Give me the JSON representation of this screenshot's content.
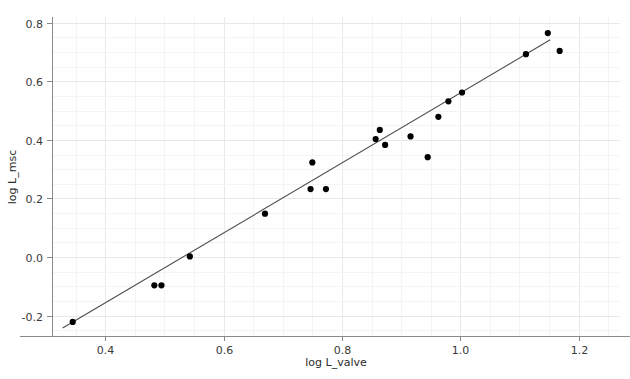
{
  "chart_data": {
    "type": "scatter",
    "title": "",
    "subtitle": "",
    "xlabel": "log L_valve",
    "ylabel": "log L_msc",
    "xlim": [
      0.31,
      1.27
    ],
    "ylim": [
      -0.27,
      0.82
    ],
    "grid": true,
    "legend": null,
    "x_ticks": [
      0.4,
      0.6,
      0.8,
      1.0,
      1.2
    ],
    "x_tick_labels": [
      "0.4",
      "0.6",
      "0.8",
      "1.0",
      "1.2"
    ],
    "y_ticks": [
      -0.2,
      0.0,
      0.2,
      0.4,
      0.6,
      0.8
    ],
    "y_tick_labels": [
      "-0.2",
      "0.0",
      "0.2",
      "0.4",
      "0.6",
      "0.8"
    ],
    "point_color": "#000000",
    "line_color": "#4d4d4d",
    "grid_color": "#e9e9e9",
    "marker_size": 3.1,
    "points": [
      {
        "x": 0.345,
        "y": -0.222
      },
      {
        "x": 0.483,
        "y": -0.097
      },
      {
        "x": 0.495,
        "y": -0.097
      },
      {
        "x": 0.543,
        "y": 0.002
      },
      {
        "x": 0.67,
        "y": 0.148
      },
      {
        "x": 0.75,
        "y": 0.323
      },
      {
        "x": 0.747,
        "y": 0.232
      },
      {
        "x": 0.773,
        "y": 0.232
      },
      {
        "x": 0.857,
        "y": 0.403
      },
      {
        "x": 0.864,
        "y": 0.434
      },
      {
        "x": 0.873,
        "y": 0.383
      },
      {
        "x": 0.916,
        "y": 0.412
      },
      {
        "x": 0.945,
        "y": 0.341
      },
      {
        "x": 0.963,
        "y": 0.479
      },
      {
        "x": 0.98,
        "y": 0.532
      },
      {
        "x": 1.003,
        "y": 0.562
      },
      {
        "x": 1.111,
        "y": 0.693
      },
      {
        "x": 1.148,
        "y": 0.765
      },
      {
        "x": 1.168,
        "y": 0.704
      }
    ],
    "fit_line": {
      "type": "linear",
      "x_start": 0.328,
      "y_start": -0.243,
      "x_end": 1.152,
      "y_end": 0.742
    }
  }
}
